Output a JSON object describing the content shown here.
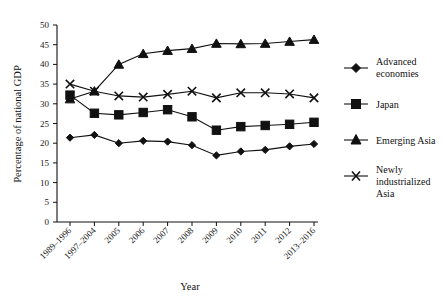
{
  "chart_data": {
    "type": "line",
    "title": "",
    "xlabel": "Year",
    "ylabel": "Percentage of national GDP",
    "categories": [
      "1989–1996",
      "1997–2004",
      "2005",
      "2006",
      "2007",
      "2008",
      "2009",
      "2010",
      "2011",
      "2012",
      "2013–2016"
    ],
    "ylim": [
      0,
      50
    ],
    "yticks": [
      0,
      5,
      10,
      15,
      20,
      25,
      30,
      35,
      40,
      45,
      50
    ],
    "grid": false,
    "legend_position": "right",
    "series": [
      {
        "name": "Advanced economies",
        "marker": "diamond",
        "values": [
          21.4,
          22.1,
          20.0,
          20.6,
          20.4,
          19.5,
          16.9,
          17.9,
          18.3,
          19.2,
          19.8
        ]
      },
      {
        "name": "Japan",
        "marker": "square",
        "values": [
          32.2,
          27.6,
          27.2,
          27.8,
          28.5,
          26.7,
          23.3,
          24.2,
          24.5,
          24.8,
          25.3
        ]
      },
      {
        "name": "Emerging Asia",
        "marker": "triangle",
        "values": [
          31.2,
          33.2,
          40.0,
          42.7,
          43.5,
          44.0,
          45.3,
          45.2,
          45.3,
          45.8,
          46.3
        ]
      },
      {
        "name": "Newly industrialized Asia",
        "marker": "x",
        "values": [
          35.0,
          33.2,
          32.0,
          31.7,
          32.4,
          33.2,
          31.5,
          32.8,
          32.8,
          32.5,
          31.5
        ]
      }
    ]
  },
  "legend": {
    "entries": [
      {
        "label_line1": "Advanced",
        "label_line2": "economies",
        "label_line3": ""
      },
      {
        "label_line1": "Japan",
        "label_line2": "",
        "label_line3": ""
      },
      {
        "label_line1": "Emerging Asia",
        "label_line2": "",
        "label_line3": ""
      },
      {
        "label_line1": "Newly",
        "label_line2": "industrialized",
        "label_line3": "Asia"
      }
    ]
  },
  "colors": {
    "ink": "#111111",
    "background": "#ffffff"
  }
}
